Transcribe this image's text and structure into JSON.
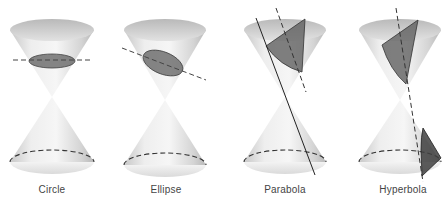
{
  "figure": {
    "panels": [
      {
        "id": "circle",
        "label": "Circle",
        "cx": 52
      },
      {
        "id": "ellipse",
        "label": "Ellipse",
        "cx": 165
      },
      {
        "id": "parabola",
        "label": "Parabola",
        "cx": 285
      },
      {
        "id": "hyperbola",
        "label": "Hyperbola",
        "cx": 400
      }
    ],
    "colors": {
      "cone_light": "#f4f4f4",
      "cone_dark": "#bdbdbd",
      "section_fill": "#6e6e6e",
      "dash": "#333333",
      "label": "#444444"
    }
  }
}
